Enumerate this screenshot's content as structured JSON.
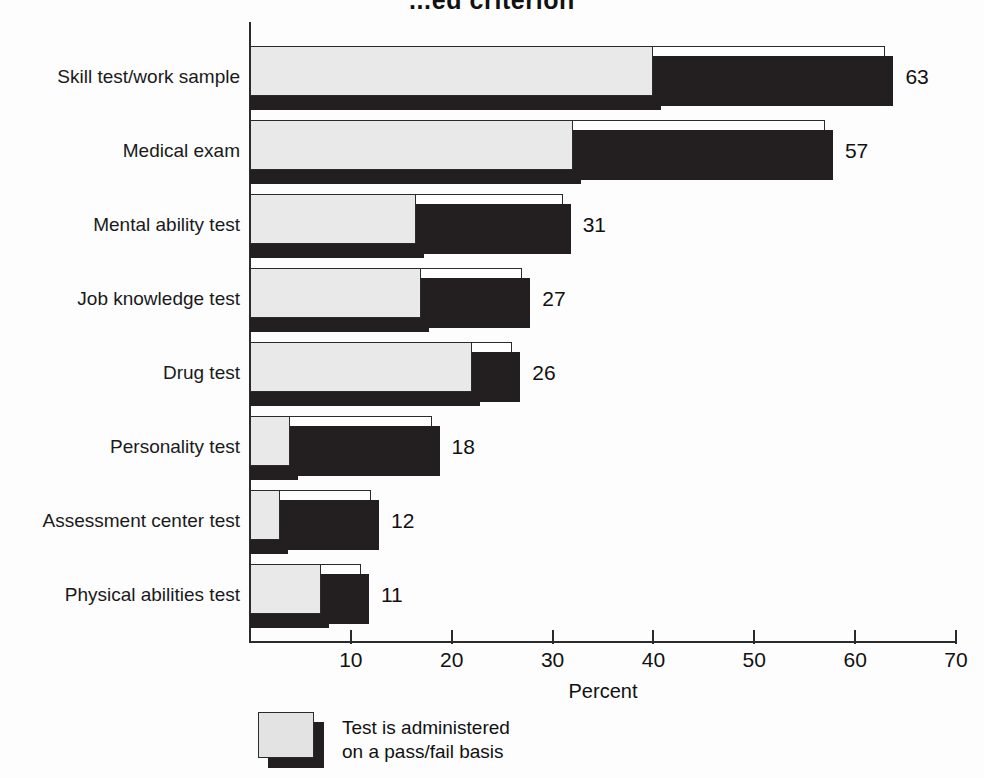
{
  "chart_data": {
    "type": "bar",
    "orientation": "horizontal",
    "title": "...ed criterion",
    "xlabel": "Percent",
    "ylabel": "",
    "xlim": [
      0,
      70
    ],
    "xticks": [
      0,
      10,
      20,
      30,
      40,
      50,
      60,
      70
    ],
    "xtick_labels": [
      "",
      "10",
      "20",
      "30",
      "40",
      "50",
      "60",
      "70"
    ],
    "grid": false,
    "legend_position": "bottom-left",
    "categories": [
      "Skill test/work sample",
      "Medical exam",
      "Mental ability test",
      "Job knowledge test",
      "Drug test",
      "Personality test",
      "Assessment center test",
      "Physical abilities test"
    ],
    "series": [
      {
        "name": "Total percent using test",
        "color": "#231f20",
        "values": [
          63,
          57,
          31,
          27,
          26,
          18,
          12,
          11
        ],
        "value_labels": [
          "63",
          "57",
          "31",
          "27",
          "26",
          "18",
          "12",
          "11"
        ]
      },
      {
        "name": "Test is administered on a pass/fail basis",
        "color": "#e9e9e9",
        "values": [
          40,
          32,
          16.5,
          17,
          22,
          4,
          3,
          7
        ]
      }
    ]
  },
  "legend": {
    "entries": [
      {
        "swatch_color": "#e3e3e3",
        "line1": "Test is administered",
        "line2": "on a pass/fail basis"
      }
    ]
  },
  "axis": {
    "x_title": "Percent"
  }
}
